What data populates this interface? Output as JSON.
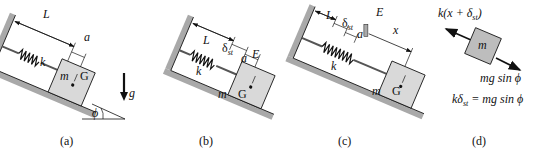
{
  "colors": {
    "incline": "#a9a9a9",
    "block": "#d9d9d9",
    "ink": "#111111",
    "background": "#ffffff"
  },
  "panels": [
    {
      "id": "a",
      "caption": "(a)",
      "labels": {
        "L": "L",
        "a": "a",
        "k": "k",
        "m": "m",
        "G": "G",
        "g": "g",
        "phi": "ϕ"
      }
    },
    {
      "id": "b",
      "caption": "(b)",
      "labels": {
        "L": "L",
        "delta": "δ",
        "delta_sub": "st",
        "a": "a",
        "E": "E",
        "k": "k",
        "m": "m",
        "G": "G"
      }
    },
    {
      "id": "c",
      "caption": "(c)",
      "labels": {
        "L": "L",
        "delta": "δ",
        "delta_sub": "st",
        "a": "a",
        "E": "E",
        "x": "x",
        "k": "k",
        "m": "m",
        "G": "G"
      }
    },
    {
      "id": "d",
      "caption": "(d)",
      "labels": {
        "spring_force": "k(x + δ",
        "spring_force_sub": "st",
        "spring_force_close": ")",
        "m": "m",
        "weight_component": "mg sin ϕ",
        "equilibrium_lhs": "kδ",
        "equilibrium_sub": "st",
        "equilibrium_rhs": " = mg sin ϕ"
      }
    }
  ]
}
